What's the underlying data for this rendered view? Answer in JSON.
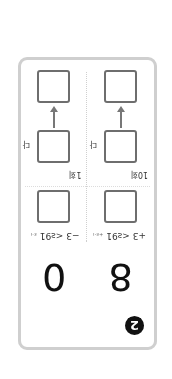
{
  "badge": {
    "label": "2"
  },
  "numbers": {
    "left": "8",
    "right": "0"
  },
  "columns": [
    {
      "label": "+3 <ƨ91",
      "sublabel": "+ε-ı",
      "count": "10회",
      "mark": "다"
    },
    {
      "label": "−3 <ƨ91",
      "sublabel": "ε-ı",
      "count": "1회",
      "mark": "다"
    }
  ],
  "colors": {
    "frame": "#cfcfcf",
    "box": "#6e6e6e",
    "badge": "#111111"
  }
}
